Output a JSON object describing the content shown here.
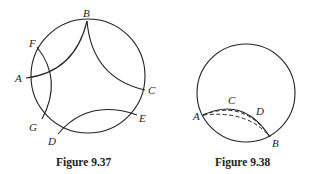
{
  "figures": [
    {
      "caption": "Figure 9.37",
      "labels": {
        "A": "A",
        "B": "B",
        "C": "C",
        "D": "D",
        "E": "E",
        "F": "F",
        "G": "G"
      }
    },
    {
      "caption": "Figure 9.38",
      "labels": {
        "A": "A",
        "B": "B",
        "C": "C",
        "D": "D"
      }
    }
  ]
}
